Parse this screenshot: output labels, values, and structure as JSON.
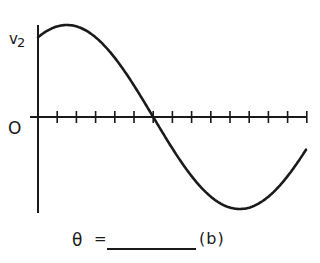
{
  "figure": {
    "y_axis_label": "v",
    "y_axis_subscript": "2",
    "origin_label": "O",
    "answer_prompt": {
      "symbol": "θ",
      "equals": "=",
      "blank": "",
      "part_label": "(b)"
    }
  },
  "chart_data": {
    "type": "line",
    "title": "",
    "xlabel": "",
    "ylabel": "v2",
    "x_ticks": 14,
    "tick_spacing_deg": 20,
    "zero_crossing_tick": 6,
    "series": [
      {
        "name": "v2",
        "x_ticks": [
          0,
          1,
          1.5,
          2,
          3,
          4,
          5,
          6,
          7,
          8,
          9,
          10,
          11,
          12,
          13,
          14
        ],
        "values": [
          0.87,
          0.98,
          1.0,
          0.98,
          0.87,
          0.64,
          0.34,
          0.0,
          -0.34,
          -0.64,
          -0.87,
          -0.98,
          -1.0,
          -0.94,
          -0.77,
          -0.5
        ]
      }
    ],
    "ylim": [
      -1,
      1
    ],
    "grid": false
  },
  "colors": {
    "ink": "#1a1a1a",
    "background": "#ffffff"
  }
}
